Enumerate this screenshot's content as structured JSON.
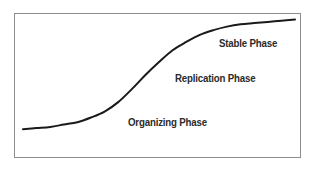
{
  "figure": {
    "background_color": "#ffffff",
    "frame_color": "#8c8c8c",
    "curve_color": "#1a1a1a",
    "label_color": "#2b2b2b"
  },
  "chart_data": {
    "type": "line",
    "title": "",
    "subtitle": "",
    "xlabel": "",
    "ylabel": "",
    "xlim": [
      0,
      100
    ],
    "ylim": [
      0,
      100
    ],
    "grid": false,
    "legend": "none",
    "axis_ticks": false,
    "series": [
      {
        "name": "Growth curve",
        "color": "#1a1a1a",
        "line_width": 2,
        "x": [
          0,
          5,
          10,
          15,
          20,
          25,
          30,
          35,
          40,
          45,
          50,
          55,
          60,
          65,
          70,
          75,
          80,
          85,
          90,
          95,
          100
        ],
        "y": [
          4,
          5,
          6,
          8,
          10,
          14,
          19,
          27,
          38,
          50,
          61,
          71,
          78,
          84,
          88,
          91,
          93,
          94,
          95,
          96,
          97
        ]
      }
    ],
    "annotations": [
      {
        "id": "stable",
        "text": "Stable Phase",
        "x": 72,
        "y": 70
      },
      {
        "id": "replication",
        "text": "Replication Phase",
        "x": 58,
        "y": 46
      },
      {
        "id": "organizing",
        "text": "Organizing Phase",
        "x": 40,
        "y": 16
      }
    ]
  },
  "labels": {
    "stable": "Stable Phase",
    "replication": "Replication Phase",
    "organizing": "Organizing Phase"
  }
}
